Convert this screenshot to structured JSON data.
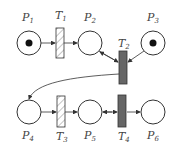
{
  "diagram": {
    "type": "petri-net",
    "places": [
      {
        "id": "P1",
        "label": "P",
        "sub": "1",
        "token": true
      },
      {
        "id": "P2",
        "label": "P",
        "sub": "2",
        "token": false
      },
      {
        "id": "P3",
        "label": "P",
        "sub": "3",
        "token": true
      },
      {
        "id": "P4",
        "label": "P",
        "sub": "4",
        "token": false
      },
      {
        "id": "P5",
        "label": "P",
        "sub": "5",
        "token": false
      },
      {
        "id": "P6",
        "label": "P",
        "sub": "6",
        "token": false
      }
    ],
    "transitions": [
      {
        "id": "T1",
        "label": "T",
        "sub": "1",
        "style": "hatched"
      },
      {
        "id": "T2",
        "label": "T",
        "sub": "2",
        "style": "filled"
      },
      {
        "id": "T3",
        "label": "T",
        "sub": "3",
        "style": "hatched"
      },
      {
        "id": "T4",
        "label": "T",
        "sub": "4",
        "style": "filled"
      }
    ],
    "arcs": [
      [
        "P1",
        "T1"
      ],
      [
        "T1",
        "P2"
      ],
      [
        "P2",
        "T2"
      ],
      [
        "T2",
        "P2"
      ],
      [
        "P3",
        "T2"
      ],
      [
        "T2",
        "P4"
      ],
      [
        "P4",
        "T3"
      ],
      [
        "T3",
        "P5"
      ],
      [
        "P5",
        "T4"
      ],
      [
        "T4",
        "P5"
      ],
      [
        "T4",
        "P6"
      ]
    ],
    "colors": {
      "stroke": "#333333",
      "filled": "#666666",
      "hatch": "#888888"
    }
  }
}
